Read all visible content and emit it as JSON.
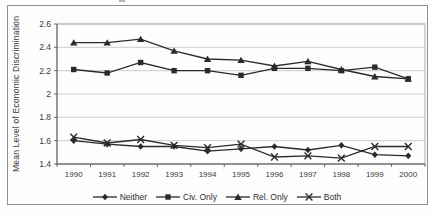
{
  "figure": {
    "ylabel": "Mean Level of Economic Discrimination"
  },
  "chart_data": {
    "type": "line",
    "title": "",
    "xlabel": "",
    "ylabel": "Mean Level of Economic Discrimination",
    "x": [
      1990,
      1991,
      1992,
      1993,
      1994,
      1995,
      1996,
      1997,
      1998,
      1999,
      2000
    ],
    "ylim": [
      1.4,
      2.6
    ],
    "ytick_labels": [
      "1.4",
      "1.6",
      "1.8",
      "2",
      "2.2",
      "2.4",
      "2.6"
    ],
    "grid": true,
    "legend_position": "bottom",
    "series": [
      {
        "name": "Neither",
        "marker": "diamond",
        "values": [
          1.6,
          1.57,
          1.55,
          1.55,
          1.51,
          1.53,
          1.55,
          1.52,
          1.56,
          1.48,
          1.47
        ]
      },
      {
        "name": "Civ. Only",
        "marker": "square",
        "values": [
          2.21,
          2.18,
          2.27,
          2.2,
          2.2,
          2.16,
          2.22,
          2.22,
          2.2,
          2.23,
          2.13
        ]
      },
      {
        "name": "Rel. Only",
        "marker": "triangle",
        "values": [
          2.44,
          2.44,
          2.47,
          2.37,
          2.3,
          2.29,
          2.24,
          2.28,
          2.21,
          2.15,
          2.13
        ]
      },
      {
        "name": "Both",
        "marker": "cross",
        "values": [
          1.63,
          1.58,
          1.61,
          1.56,
          1.54,
          1.57,
          1.46,
          1.47,
          1.45,
          1.55,
          1.55
        ]
      }
    ],
    "colors": {
      "line": "#2b2b2b",
      "marker": "#2b2b2b",
      "grid": "#b9b9b9",
      "axis": "#5a5a5a",
      "plot_border": "#9a9a9a",
      "figure_border": "#8f8f8f",
      "text": "#3a3a3a",
      "background": "#fdfdfd"
    }
  }
}
